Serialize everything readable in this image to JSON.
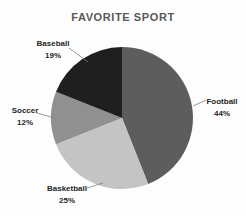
{
  "title": "FAVORITE SPORT",
  "chart_data": {
    "type": "pie",
    "title": "FAVORITE SPORT",
    "categories": [
      "Football",
      "Basketball",
      "Soccer",
      "Baseball"
    ],
    "values": [
      44,
      25,
      12,
      19
    ],
    "unit": "%",
    "start_angle_deg": 0,
    "direction": "clockwise",
    "colors": [
      "#5d5d5d",
      "#c4c4c4",
      "#909090",
      "#1f1f1f"
    ],
    "title_color": "#595959",
    "label_color": "#262626",
    "leader_line_color": "#808080",
    "labels": {
      "football": {
        "name": "Football",
        "pct": "44%"
      },
      "basketball": {
        "name": "Basketball",
        "pct": "25%"
      },
      "soccer": {
        "name": "Soccer",
        "pct": "12%"
      },
      "baseball": {
        "name": "Baseball",
        "pct": "19%"
      }
    }
  }
}
